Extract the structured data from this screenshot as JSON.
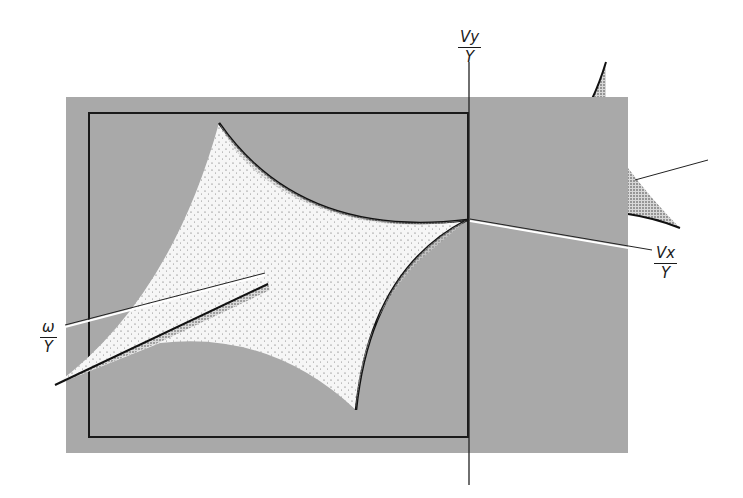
{
  "diagram": {
    "title": "",
    "colors": {
      "background": "#ffffff",
      "plane": "#a9a9a9",
      "frame": "#1a1a1a",
      "envelope_fill": "#f4f4f4",
      "envelope_edge": "#1a1a1a",
      "axis": "#222222"
    },
    "axes": {
      "vy": {
        "numerator": "Vy",
        "denominator": "Y"
      },
      "vx": {
        "numerator": "Vx",
        "denominator": "Y"
      },
      "omega": {
        "numerator": "ω",
        "denominator": "Y"
      }
    }
  }
}
